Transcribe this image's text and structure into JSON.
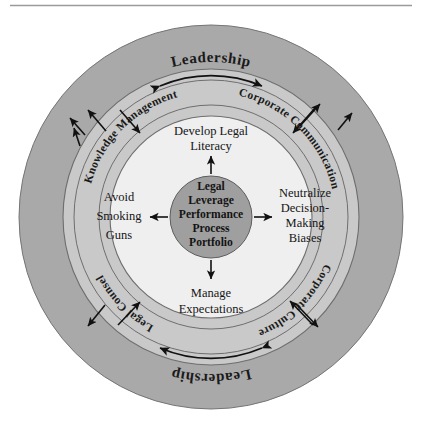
{
  "figure": {
    "background_color": "#ffffff",
    "top_rule_color": "#9a9a9a"
  },
  "colors": {
    "outer_ring": "#a9a9a9",
    "middle_ring": "#c9c9c9",
    "inner_disc": "#efefef",
    "hub": "#9f9f9f",
    "outline": "#6e6e6e",
    "text": "#141414",
    "arrow": "#111111"
  },
  "hub": {
    "name": "legal-leverage-hub",
    "lines": [
      "Legal",
      "Leverage",
      "Performance",
      "Process",
      "Portfolio"
    ]
  },
  "outer_ring": {
    "name": "leadership-ring",
    "labels": [
      {
        "position": "top",
        "text": "Leadership"
      },
      {
        "position": "bottom",
        "text": "Leadership"
      }
    ]
  },
  "middle_ring": {
    "name": "enablers-ring",
    "labels": [
      {
        "position": "upper-left",
        "text": "Knowledge Management"
      },
      {
        "position": "upper-right",
        "text": "Corporate Communication"
      },
      {
        "position": "lower-right",
        "text": "Corporate Culture"
      },
      {
        "position": "lower-left",
        "text": "Legal Counsel"
      }
    ]
  },
  "inner_nodes": [
    {
      "position": "top",
      "name": "node-develop-legal-literacy",
      "lines": [
        "Develop Legal",
        "Literacy"
      ]
    },
    {
      "position": "right",
      "name": "node-neutralize-biases",
      "lines": [
        "Neutralize",
        "Decision-",
        "Making",
        "Biases"
      ]
    },
    {
      "position": "bottom",
      "name": "node-manage-expectations",
      "lines": [
        "Manage",
        "Expectations"
      ]
    },
    {
      "position": "left",
      "name": "node-avoid-smoking-guns",
      "lines": [
        "Avoid",
        "Smoking",
        "Guns"
      ]
    }
  ],
  "connectors": {
    "hub_to_nodes": [
      "up",
      "right",
      "down",
      "left"
    ],
    "ring_arcs": [
      "top double-headed arc",
      "bottom double-headed arc"
    ],
    "radial_arrows": [
      "upper-left outward",
      "upper-left inward",
      "upper-right outward",
      "upper-right inward",
      "lower-left outward",
      "lower-left inward",
      "lower-right outward",
      "lower-right inward"
    ]
  }
}
